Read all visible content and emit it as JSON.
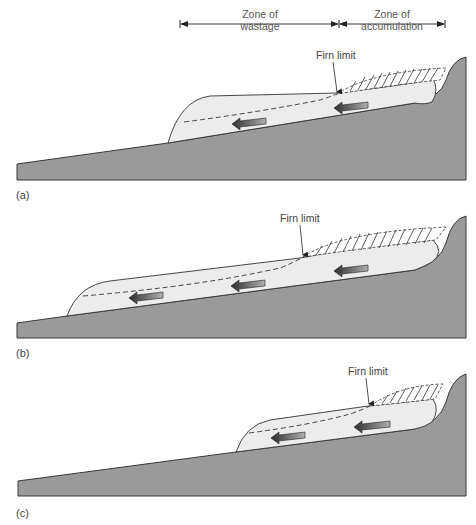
{
  "header": {
    "zones": [
      {
        "label_line1": "Zone of",
        "label_line2": "wastage"
      },
      {
        "label_line1": "Zone of",
        "label_line2": "accumulation"
      }
    ]
  },
  "panels": [
    {
      "id": "a",
      "label": "(a)",
      "firn_label": "Firn limit"
    },
    {
      "id": "b",
      "label": "(b)",
      "firn_label": "Firn limit"
    },
    {
      "id": "c",
      "label": "(c)",
      "firn_label": "Firn limit"
    }
  ],
  "colors": {
    "bedrock": "#9a9a9a",
    "bedrock_stroke": "#3a3a3a",
    "ice": "#ececec",
    "outline": "#333333",
    "arrow_dark": "#2e2e2e",
    "arrow_light": "#a8a8a8"
  }
}
